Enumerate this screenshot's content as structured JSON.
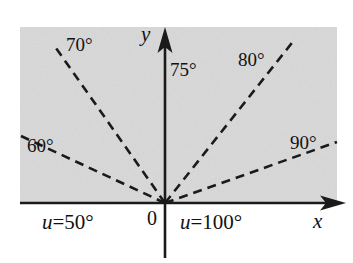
{
  "figure": {
    "background_color": "#ffffff",
    "region_color": "#d9d9d9",
    "line_color": "#1a1a1a"
  },
  "axes": {
    "x_label": "x",
    "y_label": "y",
    "origin_label": "0",
    "x_axis": {
      "x1": 20,
      "y1": 203,
      "x2": 346,
      "y2": 203
    },
    "y_axis": {
      "x1": 165,
      "y1": 258,
      "x2": 165,
      "y2": 27
    }
  },
  "region": {
    "x": 20,
    "y": 27,
    "width": 317,
    "height": 176
  },
  "rays": [
    {
      "label": "60°",
      "value": 60,
      "angle_deg": 155,
      "x1": 165,
      "y1": 203,
      "x2": 21,
      "y2": 136,
      "label_x": 27,
      "label_y": 136
    },
    {
      "label": "70°",
      "value": 70,
      "angle_deg": 125,
      "x1": 165,
      "y1": 203,
      "x2": 56,
      "y2": 48,
      "label_x": 66,
      "label_y": 35
    },
    {
      "label": "80°",
      "value": 80,
      "angle_deg": 55,
      "x1": 165,
      "y1": 203,
      "x2": 295,
      "y2": 39,
      "label_x": 238,
      "label_y": 50
    },
    {
      "label": "90°",
      "value": 90,
      "angle_deg": 20,
      "x1": 165,
      "y1": 203,
      "x2": 337,
      "y2": 142,
      "label_x": 290,
      "label_y": 133
    }
  ],
  "axis_ray": {
    "label": "75°",
    "value": 75,
    "label_x": 170,
    "label_y": 60
  },
  "boundary_labels": [
    {
      "var": "u",
      "eq": "=",
      "value": "50°",
      "x": 42,
      "y": 212
    },
    {
      "var": "u",
      "eq": "=",
      "value": "100°",
      "x": 180,
      "y": 212
    }
  ],
  "axis_label_positions": {
    "y": {
      "x": 141,
      "y": 24
    },
    "x": {
      "x": 313,
      "y": 211
    },
    "origin": {
      "x": 147,
      "y": 208
    }
  }
}
